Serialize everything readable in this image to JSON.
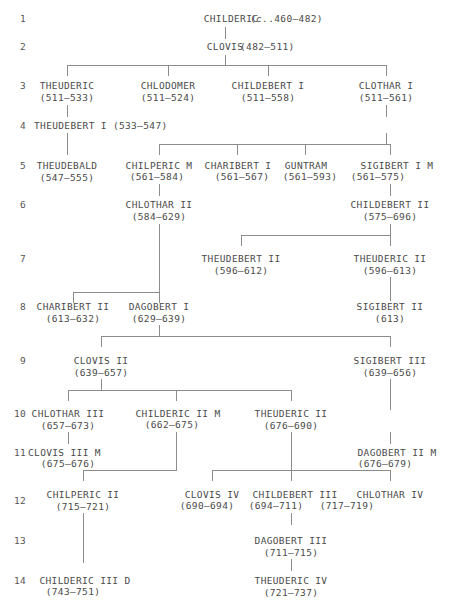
{
  "chart": {
    "type": "genealogy-tree",
    "line_color": "#8c8c8c",
    "text_color": "#4a4a4a",
    "background": "#ffffff"
  },
  "generations": [
    {
      "number": "1"
    },
    {
      "number": "2"
    },
    {
      "number": "3"
    },
    {
      "number": "4"
    },
    {
      "number": "5"
    },
    {
      "number": "6"
    },
    {
      "number": "7"
    },
    {
      "number": "8"
    },
    {
      "number": "9"
    },
    {
      "number": "10"
    },
    {
      "number": "11"
    },
    {
      "number": "12"
    },
    {
      "number": "13"
    },
    {
      "number": "14"
    }
  ],
  "people": [
    {
      "id": "childeric1",
      "name": "CHILDERIC",
      "dates": "(c.460–482)",
      "dates_prefix_italic": "c.",
      "dates_rest": ".460–482)",
      "generation": "1"
    },
    {
      "id": "clovis1",
      "name": "CLOVIS",
      "dates": "(482–511)",
      "generation": "2"
    },
    {
      "id": "theuderic1",
      "name": "THEUDERIC",
      "dates": "(511–533)",
      "generation": "3"
    },
    {
      "id": "chlodomer",
      "name": "CHLODOMER",
      "dates": "(511–524)",
      "generation": "3"
    },
    {
      "id": "childebert1",
      "name": "CHILDEBERT I",
      "dates": "(511–558)",
      "generation": "3"
    },
    {
      "id": "clothar1",
      "name": "CLOTHAR I",
      "dates": "(511–561)",
      "generation": "3"
    },
    {
      "id": "theudebert1",
      "name": "THEUDEBERT I (533–547)",
      "dates": "",
      "generation": "4"
    },
    {
      "id": "theudebald",
      "name": "THEUDEBALD",
      "dates": "(547–555)",
      "generation": "5"
    },
    {
      "id": "chilperic1",
      "name": "CHILPERIC M",
      "dates": "(561–584)",
      "generation": "5"
    },
    {
      "id": "charibert1",
      "name": "CHARIBERT I",
      "dates": "(561–567)",
      "generation": "5"
    },
    {
      "id": "guntram",
      "name": "GUNTRAM",
      "dates": "(561–593)",
      "generation": "5"
    },
    {
      "id": "sigibert1",
      "name": "SIGIBERT I M",
      "dates": "(561–575)",
      "generation": "5"
    },
    {
      "id": "chlothar2",
      "name": "CHLOTHAR II",
      "dates": "(584–629)",
      "generation": "6"
    },
    {
      "id": "childebert2",
      "name": "CHILDEBERT II",
      "dates": "(575–696)",
      "generation": "6"
    },
    {
      "id": "theudebert2",
      "name": "THEUDEBERT II",
      "dates": "(596–612)",
      "generation": "7"
    },
    {
      "id": "theuderic2a",
      "name": "THEUDERIC II",
      "dates": "(596–613)",
      "generation": "7"
    },
    {
      "id": "charibert2",
      "name": "CHARIBERT II",
      "dates": "(613–632)",
      "generation": "8"
    },
    {
      "id": "dagobert1",
      "name": "DAGOBERT I",
      "dates": "(629–639)",
      "generation": "8"
    },
    {
      "id": "sigibert2",
      "name": "SIGIBERT II",
      "dates": "(613)",
      "generation": "8"
    },
    {
      "id": "clovis2",
      "name": "CLOVIS II",
      "dates": "(639–657)",
      "generation": "9"
    },
    {
      "id": "sigibert3",
      "name": "SIGIBERT III",
      "dates": "(639–656)",
      "generation": "9"
    },
    {
      "id": "chlothar3",
      "name": "CHLOTHAR III",
      "dates": "(657–673)",
      "generation": "10"
    },
    {
      "id": "childeric2",
      "name": "CHILDERIC II M",
      "dates": "(662–675)",
      "generation": "10"
    },
    {
      "id": "theuderic2b",
      "name": "THEUDERIC II",
      "dates": "(676–690)",
      "generation": "10"
    },
    {
      "id": "clovis3",
      "name": "CLOVIS III M",
      "dates": "(675–676)",
      "generation": "11"
    },
    {
      "id": "dagobert2",
      "name": "DAGOBERT II M",
      "dates": "(676–679)",
      "generation": "11"
    },
    {
      "id": "chilperic2",
      "name": "CHILPERIC II",
      "dates": "(715–721)",
      "generation": "12"
    },
    {
      "id": "clovis4",
      "name": "CLOVIS IV",
      "dates": "(690–694)",
      "generation": "12"
    },
    {
      "id": "childebert3",
      "name": "CHILDEBERT III",
      "dates": "(694–711)",
      "generation": "12"
    },
    {
      "id": "chlothar4",
      "name": "CHLOTHAR IV",
      "dates": "(717–719)",
      "generation": "12"
    },
    {
      "id": "dagobert3",
      "name": "DAGOBERT III",
      "dates": "(711–715)",
      "generation": "13"
    },
    {
      "id": "childeric3",
      "name": "CHILDERIC III D",
      "dates": "(743–751)",
      "generation": "14"
    },
    {
      "id": "theuderic4",
      "name": "THEUDERIC IV",
      "dates": "(721–737)",
      "generation": "14"
    }
  ]
}
